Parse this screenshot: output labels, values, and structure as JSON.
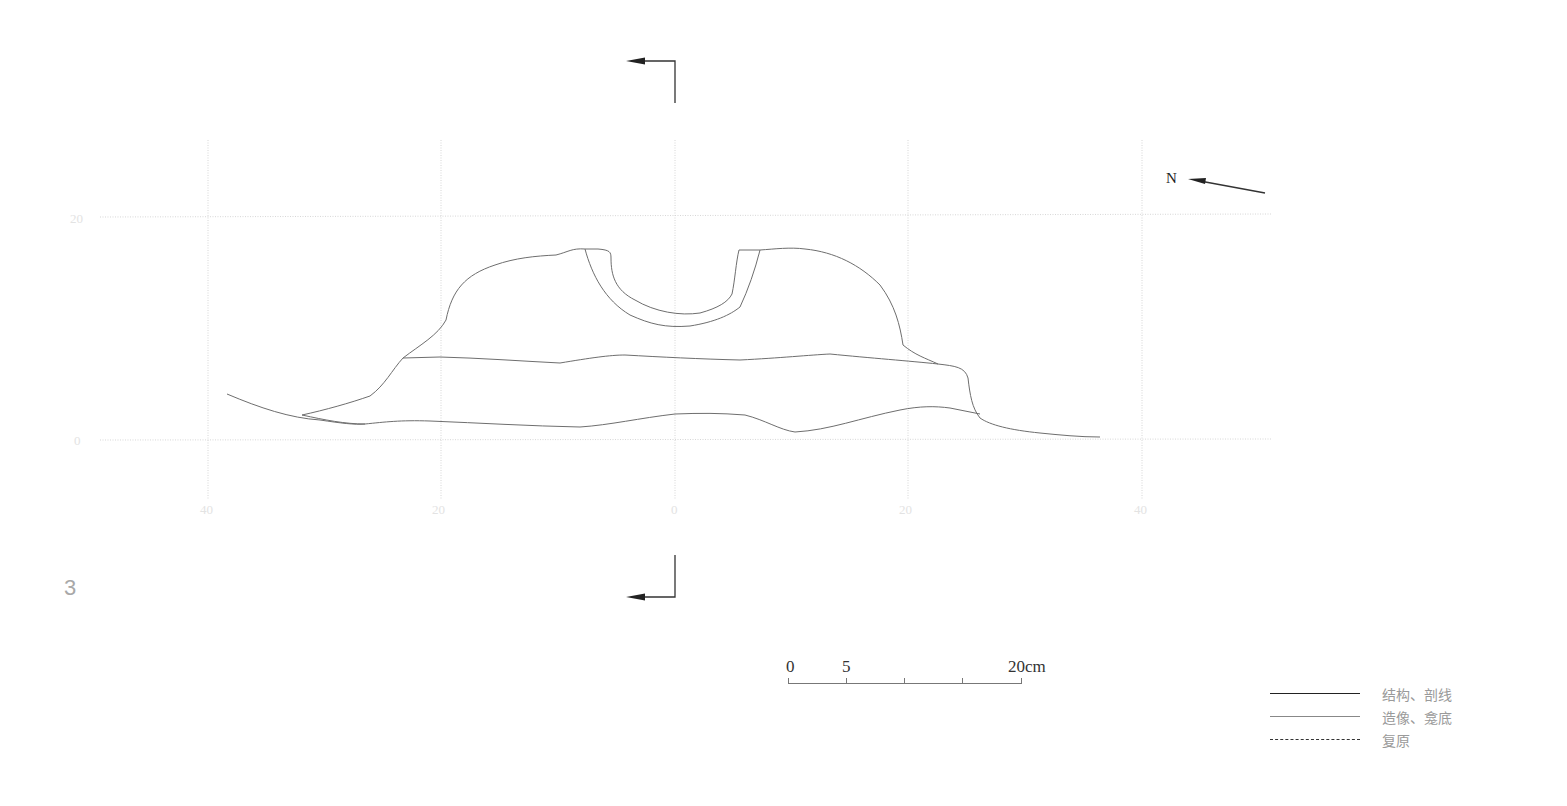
{
  "figure": {
    "number": "3",
    "north_label": "N"
  },
  "grid": {
    "x_tick_labels": [
      "40",
      "20",
      "0",
      "20",
      "40"
    ],
    "y_tick_labels": [
      "20",
      "0"
    ]
  },
  "scale_bar": {
    "labels": [
      "0",
      "5",
      "20cm"
    ]
  },
  "legend": {
    "items": [
      {
        "style": "heavy",
        "label": "结构、剖线"
      },
      {
        "style": "thin",
        "label": "造像、龛底"
      },
      {
        "style": "dashed",
        "label": "复原"
      }
    ]
  },
  "colors": {
    "profile_line": "#6e6e6e",
    "grid_line": "#d6d6d6",
    "marker_line": "#333333"
  }
}
